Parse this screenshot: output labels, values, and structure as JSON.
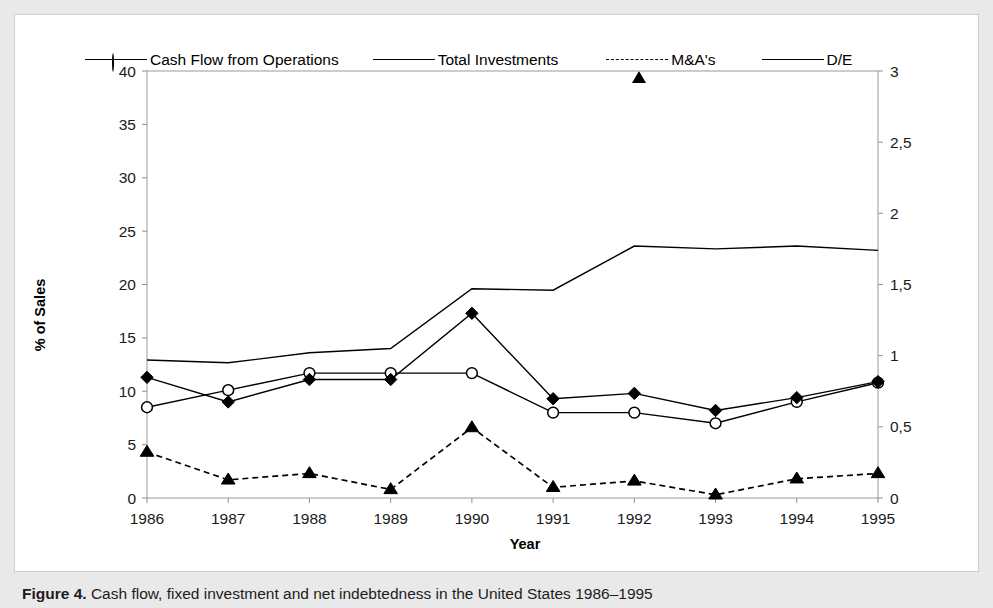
{
  "caption": {
    "label": "Figure 4.",
    "text": "Cash flow, fixed investment and net indebtedness in the United States 1986–1995"
  },
  "legend": {
    "position": "top",
    "items": [
      {
        "label": "Cash Flow from Operations",
        "marker": "circle-open-marker",
        "line": "solid",
        "color": "#000000"
      },
      {
        "label": "Total Investments",
        "marker": "diamond-filled-marker",
        "line": "solid",
        "color": "#000000"
      },
      {
        "label": "M&A's",
        "marker": "triangle-filled-marker",
        "line": "dashed",
        "color": "#000000"
      },
      {
        "label": "D/E",
        "marker": "none",
        "line": "solid",
        "color": "#000000"
      }
    ]
  },
  "chart_data": {
    "type": "line",
    "title": "",
    "xlabel": "Year",
    "ylabel": "% of Sales",
    "y2label": "",
    "categories": [
      "1986",
      "1987",
      "1988",
      "1989",
      "1990",
      "1991",
      "1992",
      "1993",
      "1994",
      "1995"
    ],
    "x": [
      1986,
      1987,
      1988,
      1989,
      1990,
      1991,
      1992,
      1993,
      1994,
      1995
    ],
    "ylim": [
      0,
      40
    ],
    "y2lim": [
      0,
      3
    ],
    "yticks": [
      "0",
      "5",
      "10",
      "15",
      "20",
      "25",
      "30",
      "35",
      "40"
    ],
    "y2ticks": [
      "0",
      "0,5",
      "1",
      "1,5",
      "2",
      "2,5",
      "3"
    ],
    "grid": false,
    "decimal_separator": ",",
    "series": [
      {
        "name": "Cash Flow from Operations",
        "axis": "left",
        "marker": "circle-open-marker",
        "line": "solid",
        "values": [
          8.5,
          10.1,
          11.7,
          11.7,
          11.7,
          8.0,
          8.0,
          7.0,
          9.0,
          10.8
        ]
      },
      {
        "name": "Total Investments",
        "axis": "left",
        "marker": "diamond-filled-marker",
        "line": "solid",
        "values": [
          11.3,
          9.0,
          11.1,
          11.1,
          17.3,
          9.3,
          9.8,
          8.2,
          9.4,
          10.9
        ]
      },
      {
        "name": "M&A's",
        "axis": "left",
        "marker": "triangle-filled-marker",
        "line": "dashed",
        "values": [
          4.3,
          1.7,
          2.3,
          0.8,
          6.6,
          1.0,
          1.6,
          0.3,
          1.8,
          2.3
        ]
      },
      {
        "name": "D/E",
        "axis": "right",
        "marker": "none",
        "line": "solid",
        "values": [
          0.97,
          0.95,
          1.02,
          1.05,
          1.47,
          1.46,
          1.77,
          1.75,
          1.77,
          1.74
        ]
      }
    ]
  },
  "colors": {
    "page_background": "#e9e9e9",
    "panel_background": "#ffffff",
    "axis": "#9a9a9a",
    "series": "#000000",
    "text": "#1a1a1a"
  }
}
